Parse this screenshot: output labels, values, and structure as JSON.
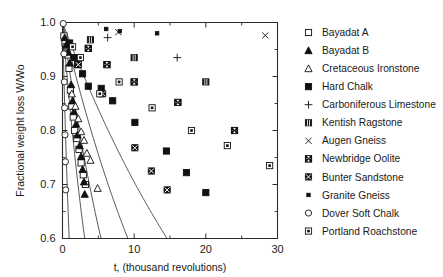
{
  "chart_data": {
    "type": "scatter",
    "title": "",
    "xlabel": "t, (thousand revolutions)",
    "ylabel": "Fractional weight loss W/Wo",
    "xlim": [
      0,
      30
    ],
    "ylim": [
      0.6,
      1.0
    ],
    "xticks": [
      0,
      10,
      20,
      30
    ],
    "xticklabels": [
      "0",
      "10",
      "20",
      "30"
    ],
    "xticks_minor": [
      5,
      15,
      25
    ],
    "yticks": [
      0.6,
      0.7,
      0.8,
      0.9,
      1.0
    ],
    "yticklabels": [
      "0.6",
      "0.7",
      "0.8",
      "0.9",
      "1.0"
    ],
    "yticks_minor": [
      0.65,
      0.75,
      0.85,
      0.95
    ],
    "grid": false,
    "legend_position": "right-outside",
    "series": [
      {
        "name": "Bayadat A",
        "marker": "open-square",
        "points": [
          [
            0.2,
            0.975
          ],
          [
            0.35,
            0.962
          ],
          [
            0.5,
            0.955
          ],
          [
            0.7,
            0.94
          ],
          [
            0.9,
            0.915
          ],
          [
            1.1,
            0.875
          ],
          [
            1.3,
            0.845
          ],
          [
            1.5,
            0.825
          ],
          [
            1.7,
            0.8
          ],
          [
            2.0,
            0.785
          ],
          [
            2.3,
            0.765
          ],
          [
            2.6,
            0.74
          ],
          [
            2.9,
            0.718
          ],
          [
            3.2,
            0.7
          ]
        ]
      },
      {
        "name": "Bayadat B",
        "marker": "filled-triangle",
        "points": [
          [
            0.3,
            0.972
          ],
          [
            0.5,
            0.958
          ],
          [
            0.8,
            0.945
          ],
          [
            1.0,
            0.925
          ],
          [
            1.2,
            0.885
          ],
          [
            1.4,
            0.855
          ],
          [
            1.6,
            0.835
          ],
          [
            1.9,
            0.812
          ],
          [
            2.1,
            0.792
          ],
          [
            2.4,
            0.772
          ],
          [
            2.6,
            0.752
          ],
          [
            2.8,
            0.728
          ],
          [
            3.0,
            0.705
          ],
          [
            3.1,
            0.682
          ]
        ]
      },
      {
        "name": "Cretaceous Ironstone",
        "marker": "open-triangle",
        "points": [
          [
            1.3,
            0.868
          ],
          [
            1.8,
            0.845
          ],
          [
            2.2,
            0.822
          ],
          [
            2.6,
            0.798
          ],
          [
            3.0,
            0.782
          ],
          [
            3.4,
            0.758
          ],
          [
            3.9,
            0.745
          ],
          [
            4.9,
            0.693
          ]
        ]
      },
      {
        "name": "Hard Chalk",
        "marker": "filled-square",
        "points": [
          [
            1.0,
            0.962
          ],
          [
            1.6,
            0.935
          ],
          [
            2.1,
            0.922
          ],
          [
            2.8,
            0.905
          ],
          [
            3.6,
            0.882
          ],
          [
            5.4,
            0.878
          ],
          [
            7.0,
            0.855
          ],
          [
            10.1,
            0.815
          ],
          [
            14.5,
            0.762
          ],
          [
            17.3,
            0.722
          ],
          [
            20.0,
            0.685
          ]
        ]
      },
      {
        "name": "Carboniferous Limestone",
        "marker": "plus",
        "points": [
          [
            6.3,
            0.972
          ],
          [
            16.0,
            0.935
          ]
        ]
      },
      {
        "name": "Kentish Ragstone",
        "marker": "grid-square",
        "points": [
          [
            3.9,
            0.968
          ],
          [
            10.0,
            0.935
          ],
          [
            20.0,
            0.89
          ]
        ]
      },
      {
        "name": "Augen Gneiss",
        "marker": "cross",
        "points": [
          [
            7.8,
            0.982
          ],
          [
            28.3,
            0.976
          ]
        ]
      },
      {
        "name": "Newbridge Oolite",
        "marker": "bowtie",
        "points": [
          [
            3.6,
            0.952
          ],
          [
            6.2,
            0.922
          ],
          [
            10.0,
            0.89
          ],
          [
            16.1,
            0.852
          ],
          [
            24.0,
            0.8
          ]
        ]
      },
      {
        "name": "Bunter Sandstone",
        "marker": "x-square",
        "points": [
          [
            2.2,
            0.922
          ],
          [
            5.6,
            0.868
          ],
          [
            10.1,
            0.768
          ],
          [
            12.4,
            0.725
          ],
          [
            14.6,
            0.69
          ]
        ]
      },
      {
        "name": "Granite Gneiss",
        "marker": "small-filled-square",
        "points": [
          [
            6.1,
            0.988
          ],
          [
            8.0,
            0.984
          ],
          [
            13.2,
            0.98
          ]
        ]
      },
      {
        "name": "Dover Soft Chalk",
        "marker": "open-circle",
        "points": [
          [
            0.1,
            0.998
          ],
          [
            0.2,
            0.942
          ],
          [
            0.25,
            0.89
          ],
          [
            0.3,
            0.842
          ],
          [
            0.35,
            0.792
          ],
          [
            0.4,
            0.742
          ],
          [
            0.45,
            0.69
          ]
        ]
      },
      {
        "name": "Portland Roachstone",
        "marker": "inner-square",
        "points": [
          [
            1.4,
            0.955
          ],
          [
            2.5,
            0.935
          ],
          [
            5.2,
            0.868
          ],
          [
            7.9,
            0.89
          ],
          [
            12.5,
            0.842
          ],
          [
            18.0,
            0.8
          ],
          [
            23.0,
            0.772
          ],
          [
            28.9,
            0.735
          ]
        ]
      }
    ],
    "curves": [
      {
        "name": "curve-1-shallow",
        "k": 0.0035
      },
      {
        "name": "curve-2",
        "k": 0.0056
      },
      {
        "name": "curve-3",
        "k": 0.0095
      },
      {
        "name": "curve-4",
        "k": 0.0165
      },
      {
        "name": "curve-5-steep",
        "k": 0.0548
      }
    ]
  },
  "legend": {
    "items": [
      {
        "label": "Bayadat A",
        "marker": "open-square"
      },
      {
        "label": "Bayadat B",
        "marker": "filled-triangle"
      },
      {
        "label": "Cretaceous Ironstone",
        "marker": "open-triangle"
      },
      {
        "label": "Hard Chalk",
        "marker": "filled-square"
      },
      {
        "label": "Carboniferous Limestone",
        "marker": "plus"
      },
      {
        "label": "Kentish Ragstone",
        "marker": "grid-square"
      },
      {
        "label": "Augen Gneiss",
        "marker": "cross"
      },
      {
        "label": "Newbridge Oolite",
        "marker": "bowtie"
      },
      {
        "label": "Bunter Sandstone",
        "marker": "x-square"
      },
      {
        "label": "Granite Gneiss",
        "marker": "small-filled-square"
      },
      {
        "label": "Dover Soft Chalk",
        "marker": "open-circle"
      },
      {
        "label": "Portland Roachstone",
        "marker": "inner-square"
      }
    ]
  },
  "colors": {
    "axis": "#2b2b2b",
    "marker": "#111111",
    "curve": "#3a3a3a",
    "background": "#ffffff"
  }
}
